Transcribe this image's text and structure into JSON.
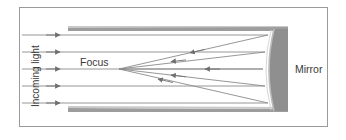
{
  "figure": {
    "name": "concave-mirror-reflecting-telescope-diagram",
    "background_color": "#ffffff",
    "frame": {
      "border_color": "#9a9a9a",
      "x": 19,
      "y": 7,
      "width": 309,
      "height": 120
    },
    "labels": {
      "incoming_light": "Incoming light",
      "focus": "Focus",
      "mirror": "Mirror"
    },
    "colors": {
      "ray_line": "#8b8b8b",
      "ray_arrow": "#6f6f6f",
      "tube_wall": "#9d9d9d",
      "tube_wall_shadow": "#c9c9c9",
      "mirror_body": "#8f8f8f",
      "mirror_edge": "#bdbdbd",
      "text": "#3a3a3a"
    },
    "geometry": {
      "focus_point": {
        "x": 119,
        "y": 69
      },
      "incoming_ray_y": [
        35,
        52,
        69,
        86,
        103
      ],
      "incoming_ray_x_start": 22,
      "incoming_ray_arrow_x": 60,
      "mirror_x_front": 270,
      "mirror_x_back": 288,
      "mirror_y_top": 29,
      "mirror_y_bottom": 111,
      "tube_top_y": 27,
      "tube_bottom_y": 110,
      "tube_x_start": 68,
      "tube_x_end": 288
    },
    "optics": {
      "reflected_rays": [
        {
          "from_y": 35,
          "arrow_x": 190
        },
        {
          "from_y": 52,
          "arrow_x": 172
        },
        {
          "from_y": 69,
          "arrow_x": 205
        },
        {
          "from_y": 86,
          "arrow_x": 172
        },
        {
          "from_y": 103,
          "arrow_x": 158
        }
      ]
    }
  }
}
